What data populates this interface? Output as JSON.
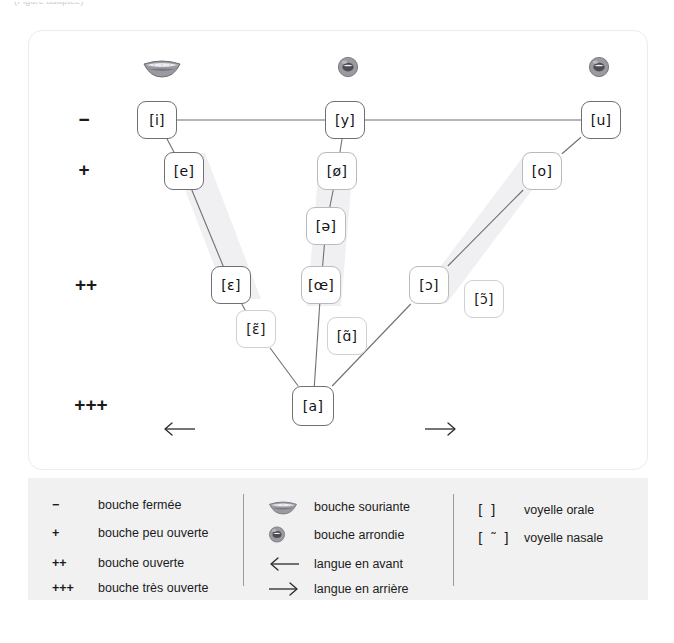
{
  "header": {
    "cropped_text": "(Figure adaptée)"
  },
  "chart_data": {
    "type": "diagram",
    "aperture_scale": [
      {
        "symbol": "−",
        "x": 55,
        "y": 88,
        "meaning": "bouche fermée"
      },
      {
        "symbol": "+",
        "x": 55,
        "y": 138,
        "meaning": "bouche peu ouverte"
      },
      {
        "symbol": "++",
        "x": 57,
        "y": 253,
        "meaning": "bouche ouverte"
      },
      {
        "symbol": "+++",
        "x": 62,
        "y": 373,
        "meaning": "bouche très ouverte"
      }
    ],
    "mouth_icons": [
      {
        "name": "smiling-mouth-icon",
        "type": "spread",
        "x": 133,
        "y": 38
      },
      {
        "name": "rounded-mouth-icon",
        "type": "rounded",
        "x": 319,
        "y": 38
      },
      {
        "name": "rounded-mouth-icon",
        "type": "rounded",
        "x": 570,
        "y": 38
      }
    ],
    "vowels": [
      {
        "label": "[i]",
        "x": 128,
        "y": 89,
        "w": 40,
        "h": 38,
        "nasal": false,
        "weight": "strong"
      },
      {
        "label": "[e]",
        "x": 155,
        "y": 140,
        "w": 40,
        "h": 38,
        "nasal": false,
        "weight": "strong"
      },
      {
        "label": "[ɛ]",
        "x": 202,
        "y": 254,
        "w": 40,
        "h": 38,
        "nasal": false,
        "weight": "strong"
      },
      {
        "label": "[ɛ̃]",
        "x": 227,
        "y": 298,
        "w": 40,
        "h": 38,
        "nasal": true,
        "weight": "soft"
      },
      {
        "label": "[y]",
        "x": 316,
        "y": 89,
        "w": 40,
        "h": 38,
        "nasal": false,
        "weight": "strong"
      },
      {
        "label": "[ø]",
        "x": 308,
        "y": 140,
        "w": 40,
        "h": 38,
        "nasal": false,
        "weight": "soft"
      },
      {
        "label": "[ə]",
        "x": 297,
        "y": 195,
        "w": 40,
        "h": 38,
        "nasal": false,
        "weight": "soft"
      },
      {
        "label": "[œ]",
        "x": 292,
        "y": 254,
        "w": 40,
        "h": 38,
        "nasal": false,
        "weight": "soft"
      },
      {
        "label": "[ɑ̃]",
        "x": 318,
        "y": 305,
        "w": 40,
        "h": 38,
        "nasal": true,
        "weight": "soft"
      },
      {
        "label": "[a]",
        "x": 284,
        "y": 375,
        "w": 42,
        "h": 40,
        "nasal": false,
        "weight": "strong"
      },
      {
        "label": "[u]",
        "x": 572,
        "y": 89,
        "w": 40,
        "h": 38,
        "nasal": false,
        "weight": "strong"
      },
      {
        "label": "[o]",
        "x": 513,
        "y": 140,
        "w": 40,
        "h": 38,
        "nasal": false,
        "weight": "soft"
      },
      {
        "label": "[ɔ]",
        "x": 400,
        "y": 254,
        "w": 40,
        "h": 38,
        "nasal": false,
        "weight": "soft"
      },
      {
        "label": "[ɔ̃]",
        "x": 455,
        "y": 268,
        "w": 40,
        "h": 38,
        "nasal": true,
        "weight": "soft"
      }
    ],
    "links": [
      {
        "from": "[i]",
        "to": "[y]"
      },
      {
        "from": "[y]",
        "to": "[u]"
      },
      {
        "from": "[i]",
        "to": "[e]"
      },
      {
        "from": "[e]",
        "to": "[ɛ]"
      },
      {
        "from": "[ɛ]",
        "to": "[ɛ̃]"
      },
      {
        "from": "[ɛ̃]",
        "to": "[a]"
      },
      {
        "from": "[y]",
        "to": "[ø]"
      },
      {
        "from": "[ø]",
        "to": "[ə]"
      },
      {
        "from": "[ə]",
        "to": "[œ]"
      },
      {
        "from": "[œ]",
        "to": "[a]"
      },
      {
        "from": "[u]",
        "to": "[o]"
      },
      {
        "from": "[o]",
        "to": "[ɔ]"
      },
      {
        "from": "[ɔ]",
        "to": "[a]"
      }
    ],
    "shading_bands": [
      {
        "name": "front-series-band",
        "points": "142,122 176,122 232,268 198,268"
      },
      {
        "name": "central-series-band",
        "points": "291,122 325,122 312,275 278,275"
      },
      {
        "name": "back-series-band",
        "points": "497,122 531,122 418,272 384,272"
      }
    ],
    "tongue_arrows": [
      {
        "name": "tongue-front-arrow",
        "direction": "left",
        "x": 150,
        "y": 400,
        "meaning": "langue en avant"
      },
      {
        "name": "tongue-back-arrow",
        "direction": "right",
        "x": 412,
        "y": 400,
        "meaning": "langue en arrière"
      }
    ]
  },
  "legend": {
    "columns": [
      {
        "name": "aperture-legend",
        "left": 24,
        "rows": [
          {
            "symbol": "−",
            "text": "bouche fermée",
            "icon": null
          },
          {
            "symbol": "+",
            "text": "bouche peu ouverte",
            "icon": null
          },
          {
            "symbol": "++",
            "text": "bouche ouverte",
            "icon": null
          },
          {
            "symbol": "+++",
            "text": "bouche très ouverte",
            "icon": null
          }
        ]
      },
      {
        "name": "lip-tongue-legend",
        "left": 240,
        "rows": [
          {
            "symbol": "",
            "text": "bouche souriante",
            "icon": "smiling-mouth-icon"
          },
          {
            "symbol": "",
            "text": "bouche arrondie",
            "icon": "rounded-mouth-icon"
          },
          {
            "symbol": "",
            "text": "langue en avant",
            "icon": "arrow-left-icon"
          },
          {
            "symbol": "",
            "text": "langue en arrière",
            "icon": "arrow-right-icon"
          }
        ]
      },
      {
        "name": "notation-legend",
        "left": 450,
        "rows": [
          {
            "symbol": "[   ]",
            "text": "voyelle orale",
            "icon": null
          },
          {
            "symbol": "[ ˜ ]",
            "text": "voyelle nasale",
            "icon": null
          }
        ]
      }
    ],
    "dividers": [
      215,
      425
    ]
  },
  "colors": {
    "card_background": "#ffffff",
    "card_border": "#ececf0",
    "legend_background": "#f1f1f1",
    "box_border_strong": "#6f6f76",
    "box_border_soft": "#b9b9c2",
    "box_border_nasal": "#cfcfd6",
    "link_line": "#6f6f76",
    "shading": "#f0f0f2",
    "text": "#1b1b1b",
    "mouth_icon": "#8c8c92"
  }
}
